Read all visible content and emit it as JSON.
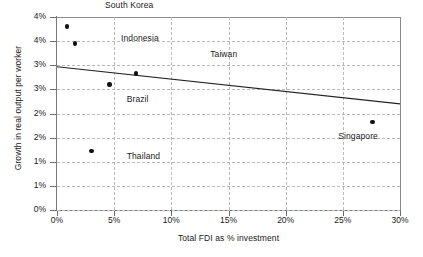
{
  "chart_data": {
    "type": "scatter",
    "title": "",
    "xlabel": "Total FDI as % investment",
    "ylabel": "Growth in real output per worker",
    "xlim": [
      0,
      30
    ],
    "ylim": [
      0,
      4
    ],
    "grid": true,
    "legend": "none",
    "x_ticks": [
      0,
      5,
      10,
      15,
      20,
      25,
      30
    ],
    "x_tick_labels": [
      "0%",
      "5%",
      "10%",
      "15%",
      "20%",
      "25%",
      "30%"
    ],
    "y_ticks": [
      0,
      0.5,
      1.0,
      1.5,
      2.0,
      2.5,
      3.0,
      3.5,
      4.0
    ],
    "y_tick_labels": [
      "0%",
      "1%",
      "1%",
      "2%",
      "2%",
      "3%",
      "3%",
      "4%",
      "4%"
    ],
    "points": [
      {
        "name": "South Korea",
        "x": 0.9,
        "y": 3.8,
        "label": "South Korea",
        "label_x": 4.2,
        "label_y": 4.22
      },
      {
        "name": "Indonesia",
        "x": 1.6,
        "y": 3.45,
        "label": "Indonesia",
        "label_x": 5.6,
        "label_y": 3.55
      },
      {
        "name": "Taiwan",
        "x": 6.9,
        "y": 2.83,
        "label": "Taiwan",
        "label_x": 13.4,
        "label_y": 3.22
      },
      {
        "name": "Brazil",
        "x": 4.6,
        "y": 2.6,
        "label": "Brazil",
        "label_x": 6.1,
        "label_y": 2.28
      },
      {
        "name": "Singapore",
        "x": 27.6,
        "y": 1.83,
        "label": "Singapore",
        "label_x": 24.6,
        "label_y": 1.52
      },
      {
        "name": "Thailand",
        "x": 3.0,
        "y": 1.22,
        "label": "Thailand",
        "label_x": 6.1,
        "label_y": 1.1
      }
    ],
    "trendline": {
      "name": "linear fit",
      "x_start": 0,
      "y_start": 2.97,
      "x_end": 30,
      "y_end": 2.2
    },
    "series": [
      {
        "name": "Countries",
        "x": [
          0.9,
          1.6,
          6.9,
          4.6,
          27.6,
          3.0
        ],
        "values": [
          3.8,
          3.45,
          2.83,
          2.6,
          1.83,
          1.22
        ]
      }
    ]
  }
}
